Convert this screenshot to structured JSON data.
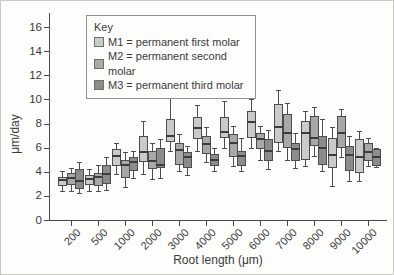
{
  "legend": {
    "title": "Key",
    "entries": [
      {
        "id": "M1",
        "label": "M1 = permanent first molar",
        "color": "#c9cbc7"
      },
      {
        "id": "M2",
        "label": "M2 = permanent second molar",
        "color": "#a7a9a5"
      },
      {
        "id": "M3",
        "label": "M3 = permanent third molar",
        "color": "#8b8d89"
      }
    ]
  },
  "chart_data": {
    "type": "boxplot",
    "title": "",
    "xlabel": "Root length (μm)",
    "ylabel": "μm/day",
    "ylim": [
      0,
      17
    ],
    "y_ticks": [
      0,
      2,
      4,
      6,
      8,
      10,
      12,
      14,
      16
    ],
    "grid": false,
    "legend_position": "top-left",
    "categories": [
      "200",
      "500",
      "1000",
      "2000",
      "3000",
      "4000",
      "5000",
      "6000",
      "7000",
      "8000",
      "9000",
      "10000"
    ],
    "box_format": [
      "whisker_low",
      "q1",
      "median",
      "q3",
      "whisker_high"
    ],
    "series": [
      {
        "name": "M1",
        "color": "#c9cbc7",
        "boxes": [
          [
            2.4,
            2.8,
            3.3,
            3.6,
            4.1
          ],
          [
            2.4,
            2.9,
            3.4,
            3.7,
            4.2
          ],
          [
            3.8,
            4.5,
            5.3,
            5.9,
            6.4
          ],
          [
            3.8,
            4.8,
            5.6,
            7.0,
            8.2
          ],
          [
            5.7,
            6.5,
            7.0,
            8.4,
            10.2
          ],
          [
            5.7,
            6.7,
            7.6,
            8.5,
            9.5
          ],
          [
            6.0,
            6.8,
            7.3,
            8.5,
            9.9
          ],
          [
            6.0,
            6.8,
            8.1,
            9.0,
            10.0
          ],
          [
            5.7,
            6.4,
            7.7,
            9.6,
            10.8
          ],
          [
            4.5,
            5.0,
            7.2,
            8.2,
            9.0
          ],
          [
            2.8,
            4.3,
            5.4,
            6.8,
            7.7
          ],
          [
            3.2,
            3.9,
            5.2,
            6.7,
            7.4
          ]
        ]
      },
      {
        "name": "M2",
        "color": "#a7a9a5",
        "boxes": [
          [
            2.4,
            2.9,
            3.5,
            3.9,
            4.3
          ],
          [
            2.4,
            2.8,
            3.6,
            3.9,
            4.6
          ],
          [
            2.7,
            3.5,
            4.6,
            5.0,
            5.6
          ],
          [
            3.4,
            4.2,
            4.9,
            5.7,
            6.4
          ],
          [
            4.1,
            4.6,
            5.8,
            6.4,
            7.1
          ],
          [
            4.8,
            5.5,
            6.3,
            7.0,
            7.7
          ],
          [
            4.5,
            5.2,
            6.4,
            7.1,
            7.8
          ],
          [
            5.0,
            5.9,
            6.7,
            7.2,
            7.8
          ],
          [
            5.0,
            6.0,
            7.2,
            8.8,
            9.7
          ],
          [
            5.3,
            6.1,
            6.8,
            8.6,
            9.4
          ],
          [
            5.2,
            6.0,
            7.2,
            8.6,
            9.2
          ],
          [
            4.5,
            4.9,
            5.6,
            6.4,
            6.8
          ]
        ]
      },
      {
        "name": "M3",
        "color": "#8b8d89",
        "boxes": [
          [
            2.2,
            2.6,
            3.2,
            4.2,
            4.8
          ],
          [
            2.5,
            3.0,
            3.8,
            4.6,
            5.2
          ],
          [
            3.5,
            4.1,
            4.8,
            5.2,
            5.7
          ],
          [
            3.5,
            4.3,
            4.6,
            6.0,
            6.7
          ],
          [
            3.7,
            4.3,
            5.2,
            5.6,
            6.1
          ],
          [
            4.1,
            4.5,
            5.0,
            5.5,
            6.0
          ],
          [
            4.1,
            4.5,
            5.3,
            5.7,
            6.8
          ],
          [
            4.2,
            4.9,
            5.7,
            6.7,
            7.5
          ],
          [
            4.3,
            4.9,
            5.9,
            6.4,
            7.2
          ],
          [
            4.1,
            4.6,
            6.0,
            7.0,
            8.4
          ],
          [
            3.2,
            4.1,
            5.4,
            6.1,
            7.0
          ],
          [
            4.4,
            4.5,
            5.2,
            5.9,
            6.0
          ]
        ]
      }
    ]
  }
}
